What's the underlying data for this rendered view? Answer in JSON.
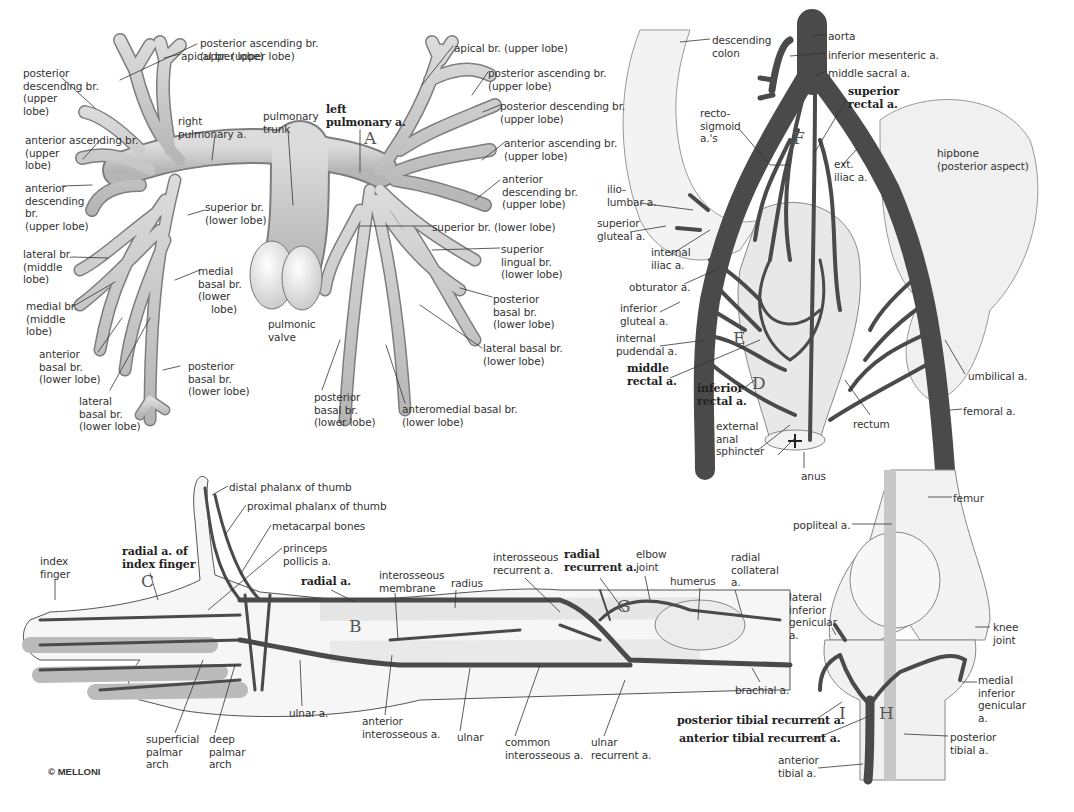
{
  "copyright": "© MELLONI",
  "colors": {
    "artery_light": "#c9c9c9",
    "artery_light_edge": "#7a7a7a",
    "artery_dark": "#4a4a4a",
    "bone": "#f1f1f1",
    "bone_edge": "#8a8a8a",
    "leader": "#333333"
  },
  "panels": {
    "pulmonary": {
      "letters": {
        "A": "A"
      },
      "labels": [
        {
          "id": "posterior-ascending-br-right",
          "text": "posterior ascending br.\n(upper lobe)",
          "x": 200,
          "y": 37
        },
        {
          "id": "apical-br-right",
          "text": "apical br. (upper lobe)",
          "x": 181,
          "y": 50
        },
        {
          "id": "posterior-descending-br-right",
          "text": "posterior\ndescending br.\n(upper\nlobe)",
          "x": 23,
          "y": 67
        },
        {
          "id": "right-pulmonary-a",
          "text": "right\npulmonary a.",
          "x": 178,
          "y": 115
        },
        {
          "id": "pulmonary-trunk",
          "text": "pulmonary\ntrunk",
          "x": 263,
          "y": 110
        },
        {
          "id": "anterior-ascending-br-right",
          "text": "anterior ascending br.\n(upper\nlobe)",
          "x": 25,
          "y": 134
        },
        {
          "id": "anterior-descending-br-right",
          "text": "anterior\ndescending\nbr.\n(upper lobe)",
          "x": 25,
          "y": 182
        },
        {
          "id": "superior-br-lower-right",
          "text": "superior br.\n(lower lobe)",
          "x": 205,
          "y": 201
        },
        {
          "id": "lateral-br-middle",
          "text": "lateral br.\n(middle\nlobe)",
          "x": 23,
          "y": 248
        },
        {
          "id": "medial-basal-br",
          "text": "medial\nbasal br.\n(lower\n    lobe)",
          "x": 198,
          "y": 265
        },
        {
          "id": "pulmonic-valve",
          "text": "pulmonic\nvalve",
          "x": 268,
          "y": 318
        },
        {
          "id": "medial-br-middle",
          "text": "medial br.\n(middle\nlobe)",
          "x": 26,
          "y": 300
        },
        {
          "id": "anterior-basal-br",
          "text": "anterior\nbasal br.\n(lower lobe)",
          "x": 39,
          "y": 348
        },
        {
          "id": "posterior-basal-br-right",
          "text": "posterior\nbasal br.\n(lower lobe)",
          "x": 188,
          "y": 360
        },
        {
          "id": "lateral-basal-br-right",
          "text": "lateral\nbasal br.\n(lower lobe)",
          "x": 79,
          "y": 395
        },
        {
          "id": "left-pulmonary-a",
          "text": "left\npulmonary a.",
          "x": 326,
          "y": 107,
          "bold": true
        },
        {
          "id": "apical-br-left",
          "text": "apical br. (upper lobe)",
          "x": 454,
          "y": 42
        },
        {
          "id": "posterior-ascending-br-left",
          "text": "posterior ascending br.\n(upper lobe)",
          "x": 488,
          "y": 67
        },
        {
          "id": "posterior-descending-br-left",
          "text": "posterior descending br.\n(upper lobe)",
          "x": 500,
          "y": 100
        },
        {
          "id": "anterior-ascending-br-left",
          "text": "anterior ascending br.\n(upper lobe)",
          "x": 504,
          "y": 137
        },
        {
          "id": "anterior-descending-br-left",
          "text": "anterior\ndescending br.\n(upper lobe)",
          "x": 502,
          "y": 173
        },
        {
          "id": "superior-br-lower-left",
          "text": "superior br. (lower lobe)",
          "x": 432,
          "y": 221
        },
        {
          "id": "superior-lingual-br",
          "text": "superior\nlingual br.\n(lower lobe)",
          "x": 501,
          "y": 243
        },
        {
          "id": "posterior-basal-br-left-lateral",
          "text": "posterior\nbasal br.\n(lower lobe)",
          "x": 493,
          "y": 293
        },
        {
          "id": "lateral-basal-br-left",
          "text": "lateral basal br.\n(lower lobe)",
          "x": 483,
          "y": 342
        },
        {
          "id": "posterior-basal-br-left",
          "text": "posterior\nbasal br.\n(lower lobe)",
          "x": 314,
          "y": 391
        },
        {
          "id": "anteromedial-basal-br",
          "text": "anteromedial basal br.\n(lower lobe)",
          "x": 402,
          "y": 403
        }
      ]
    },
    "pelvic": {
      "letters": {
        "F": "F",
        "E": "E",
        "D": "D"
      },
      "labels": [
        {
          "id": "descending-colon",
          "text": "descending\ncolon",
          "x": 712,
          "y": 34
        },
        {
          "id": "aorta",
          "text": "aorta",
          "x": 828,
          "y": 30
        },
        {
          "id": "inferior-mesenteric-a",
          "text": "inferior mesenteric a.",
          "x": 828,
          "y": 49
        },
        {
          "id": "middle-sacral-a",
          "text": "middle sacral a.",
          "x": 828,
          "y": 67
        },
        {
          "id": "superior-rectal-a",
          "text": "superior\nrectal a.",
          "x": 848,
          "y": 88,
          "bold": true
        },
        {
          "id": "recto-sigmoid-as",
          "text": "recto-\nsigmoid\na.'s",
          "x": 700,
          "y": 107
        },
        {
          "id": "ext-iliac-a",
          "text": "ext.\niliac a.",
          "x": 834,
          "y": 158
        },
        {
          "id": "hipbone",
          "text": "hipbone\n(posterior aspect)",
          "x": 937,
          "y": 147
        },
        {
          "id": "ilio-lumbar-a",
          "text": "ilio-\nlumbar a.",
          "x": 607,
          "y": 183
        },
        {
          "id": "superior-gluteal-a",
          "text": "superior\ngluteal a.",
          "x": 597,
          "y": 217
        },
        {
          "id": "internal-iliac-a",
          "text": "internal\niliac a.",
          "x": 651,
          "y": 246
        },
        {
          "id": "obturator-a",
          "text": "obturator a.",
          "x": 629,
          "y": 281
        },
        {
          "id": "inferior-gluteal-a",
          "text": "inferior\ngluteal a.",
          "x": 620,
          "y": 302
        },
        {
          "id": "internal-pudendal-a",
          "text": "internal\npudendal a.",
          "x": 616,
          "y": 332
        },
        {
          "id": "middle-rectal-a",
          "text": "middle\nrectal a.",
          "x": 627,
          "y": 365,
          "bold": true
        },
        {
          "id": "inferior-rectal-a",
          "text": "inferior\nrectal a.",
          "x": 697,
          "y": 385,
          "bold": true
        },
        {
          "id": "external-anal-sphincter",
          "text": "external\nanal\nsphincter",
          "x": 716,
          "y": 420
        },
        {
          "id": "rectum",
          "text": "rectum",
          "x": 853,
          "y": 418
        },
        {
          "id": "anus",
          "text": "anus",
          "x": 801,
          "y": 470
        },
        {
          "id": "umbilical-a",
          "text": "umbilical a.",
          "x": 968,
          "y": 370
        },
        {
          "id": "femoral-a",
          "text": "femoral a.",
          "x": 963,
          "y": 405
        }
      ]
    },
    "hand_forearm": {
      "letters": {
        "C": "C",
        "B": "B",
        "G": "G"
      },
      "labels": [
        {
          "id": "distal-phalanx-of-thumb",
          "text": "distal phalanx of thumb",
          "x": 229,
          "y": 481
        },
        {
          "id": "proximal-phalanx-of-thumb",
          "text": "proximal phalanx of thumb",
          "x": 247,
          "y": 500
        },
        {
          "id": "metacarpal-bones",
          "text": "metacarpal bones",
          "x": 272,
          "y": 520
        },
        {
          "id": "princeps-pollicis-a",
          "text": "princeps\npollicis a.",
          "x": 283,
          "y": 542
        },
        {
          "id": "radial-a-of-index-finger",
          "text": "radial a. of\nindex finger",
          "x": 122,
          "y": 548,
          "bold": true
        },
        {
          "id": "index-finger",
          "text": "index\nfinger",
          "x": 40,
          "y": 555
        },
        {
          "id": "radial-a",
          "text": "radial a.",
          "x": 301,
          "y": 578,
          "bold": true
        },
        {
          "id": "interosseous-membrane",
          "text": "interosseous\nmembrane",
          "x": 379,
          "y": 569
        },
        {
          "id": "radius",
          "text": "radius",
          "x": 451,
          "y": 577
        },
        {
          "id": "interosseous-recurrent-a",
          "text": "interosseous\nrecurrent a.",
          "x": 493,
          "y": 551
        },
        {
          "id": "radial-recurrent-a",
          "text": "radial\nrecurrent a.",
          "x": 564,
          "y": 551,
          "bold": true
        },
        {
          "id": "elbow-joint",
          "text": "elbow\njoint",
          "x": 636,
          "y": 548
        },
        {
          "id": "humerus",
          "text": "humerus",
          "x": 670,
          "y": 575
        },
        {
          "id": "radial-collateral-a",
          "text": "radial\ncollateral\na.",
          "x": 731,
          "y": 551
        },
        {
          "id": "brachial-a",
          "text": "brachial a.",
          "x": 735,
          "y": 684
        },
        {
          "id": "ulnar-a",
          "text": "ulnar a.",
          "x": 289,
          "y": 707
        },
        {
          "id": "anterior-interosseous-a",
          "text": "anterior\ninterosseous a.",
          "x": 362,
          "y": 715
        },
        {
          "id": "ulnar",
          "text": "ulnar",
          "x": 457,
          "y": 731
        },
        {
          "id": "common-interosseous-a",
          "text": "common\ninterosseous a.",
          "x": 505,
          "y": 736
        },
        {
          "id": "ulnar-recurrent-a",
          "text": "ulnar\nrecurrent a.",
          "x": 591,
          "y": 736
        },
        {
          "id": "superficial-palmar-arch",
          "text": "superficial\npalmar\narch",
          "x": 146,
          "y": 733
        },
        {
          "id": "deep-palmar-arch",
          "text": "deep\npalmar\narch",
          "x": 209,
          "y": 733
        }
      ]
    },
    "knee": {
      "letters": {
        "I": "I",
        "H": "H"
      },
      "labels": [
        {
          "id": "femur",
          "text": "femur",
          "x": 953,
          "y": 492
        },
        {
          "id": "popliteal-a",
          "text": "popliteal a.",
          "x": 793,
          "y": 519
        },
        {
          "id": "lateral-inferior-genicular-a",
          "text": "lateral\ninferior\ngenicular\na.",
          "x": 789,
          "y": 591
        },
        {
          "id": "knee-joint",
          "text": "knee\njoint",
          "x": 993,
          "y": 621
        },
        {
          "id": "medial-inferior-genicular-a",
          "text": "medial\ninferior\ngenicular\na.",
          "x": 978,
          "y": 674
        },
        {
          "id": "posterior-tibial-recurrent-a",
          "text": "posterior tibial recurrent a.",
          "x": 677,
          "y": 717,
          "bold": true
        },
        {
          "id": "anterior-tibial-recurrent-a",
          "text": "anterior tibial recurrent a.",
          "x": 679,
          "y": 735,
          "bold": true
        },
        {
          "id": "posterior-tibial-a",
          "text": "posterior\ntibial a.",
          "x": 950,
          "y": 731
        },
        {
          "id": "anterior-tibial-a",
          "text": "anterior\ntibial a.",
          "x": 778,
          "y": 754
        }
      ]
    }
  }
}
